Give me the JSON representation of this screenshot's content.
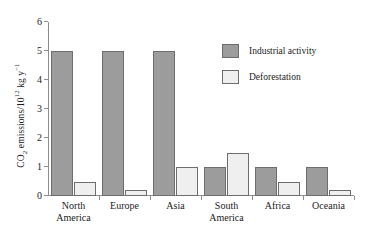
{
  "chart_data": {
    "type": "bar",
    "title": "",
    "xlabel": "",
    "ylabel": "CO2 emissions/10^12 kg y^-1",
    "ylabel_parts": {
      "prefix": "CO",
      "sub": "2",
      "mid": " emissions/10",
      "sup_exp": "12",
      "unit": " kg y",
      "sup_unit": "−1"
    },
    "categories": [
      "North America",
      "Europe",
      "Asia",
      "South America",
      "Africa",
      "Oceania"
    ],
    "category_lines": [
      [
        "North",
        "America"
      ],
      [
        "Europe",
        ""
      ],
      [
        "Asia",
        ""
      ],
      [
        "South",
        "America"
      ],
      [
        "Africa",
        ""
      ],
      [
        "Oceania",
        ""
      ]
    ],
    "series": [
      {
        "name": "Industrial activity",
        "values": [
          5.0,
          5.0,
          5.0,
          1.0,
          1.0,
          1.0
        ]
      },
      {
        "name": "Deforestation",
        "values": [
          0.5,
          0.2,
          1.0,
          1.5,
          0.5,
          0.2
        ]
      }
    ],
    "ylim": [
      0,
      6
    ],
    "yticks": [
      0,
      1,
      2,
      3,
      4,
      5,
      6
    ],
    "ytick_labels": [
      "0",
      "1",
      "2",
      "3",
      "4",
      "5",
      "6"
    ],
    "grid": false,
    "legend_position": "top-right",
    "colors": {
      "industrial_fill": "#9c9c9c",
      "deforestation_fill": "#efefef",
      "bar_outline": "#6d6d6d",
      "axis": "#8d8d8d",
      "text": "#1b1b1b"
    }
  },
  "legend": {
    "items": [
      {
        "label": "Industrial activity",
        "pattern": "solid-gray"
      },
      {
        "label": "Deforestation",
        "pattern": "stippled-dots"
      }
    ]
  }
}
